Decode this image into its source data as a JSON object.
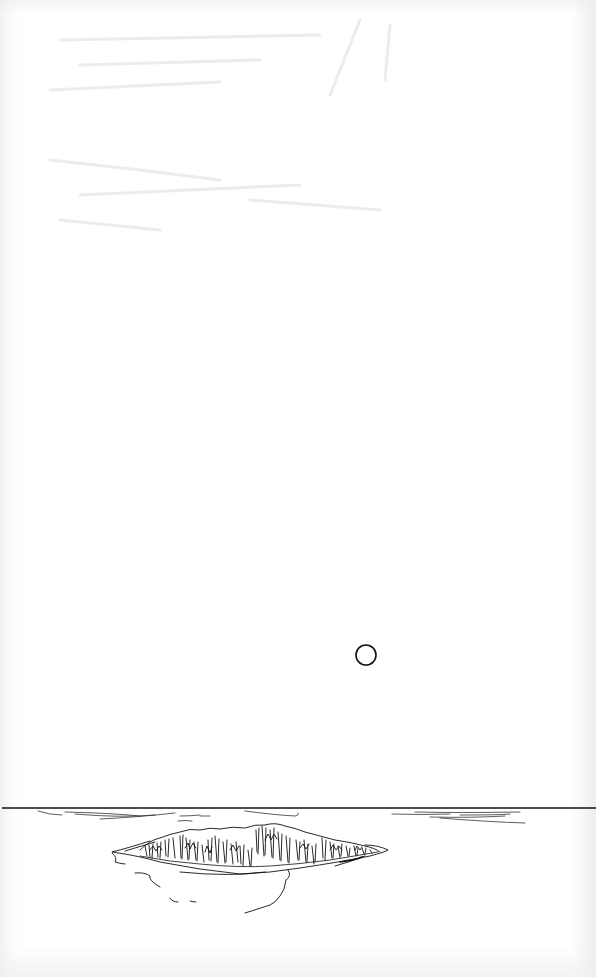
{
  "page": {
    "kind": "scanned-illustration-page",
    "background_color": "#ffffff",
    "ink_color": "#111111"
  },
  "illustration": {
    "subject": "island on the horizon with a small circle in the sky",
    "elements": [
      {
        "name": "sky-circle",
        "shape": "circle",
        "cx": 366,
        "cy": 655,
        "r": 10
      },
      {
        "name": "horizon-line",
        "shape": "line",
        "y": 808,
        "x1": 0,
        "x2": 596
      },
      {
        "name": "island",
        "shape": "hatched-mound",
        "x_range": [
          112,
          388
        ],
        "y_range": [
          822,
          910
        ]
      },
      {
        "name": "water-ripples-left",
        "shape": "strokes",
        "x_range": [
          35,
          200
        ]
      },
      {
        "name": "water-ripples-right",
        "shape": "strokes",
        "x_range": [
          390,
          530
        ]
      }
    ]
  }
}
